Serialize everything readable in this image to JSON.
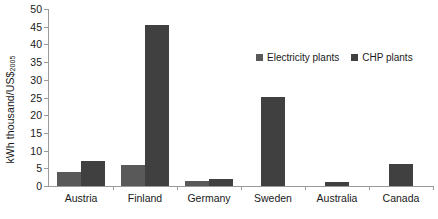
{
  "chart_data": {
    "type": "bar",
    "title": "",
    "xlabel": "",
    "ylabel": "kWh thousand/US$",
    "ylabel_subscript": "2005",
    "ylim": [
      0,
      50
    ],
    "ytick_step": 5,
    "grid": false,
    "legend_position": "upper right inside",
    "categories": [
      "Austria",
      "Finland",
      "Germany",
      "Sweden",
      "Australia",
      "Canada"
    ],
    "ytick_labels": [
      "50",
      "45",
      "40",
      "35",
      "30",
      "25",
      "20",
      "15",
      "10",
      "5",
      "0"
    ],
    "series": [
      {
        "name": "Electricity plants",
        "color": "#595959",
        "values": [
          4.0,
          6.0,
          1.5,
          null,
          null,
          null
        ]
      },
      {
        "name": "CHP plants",
        "color": "#404040",
        "values": [
          7.0,
          45.5,
          2.1,
          25.1,
          1.1,
          6.2
        ]
      }
    ]
  },
  "legend": {
    "entries": [
      {
        "label": "Electricity plants"
      },
      {
        "label": "CHP plants"
      }
    ]
  }
}
